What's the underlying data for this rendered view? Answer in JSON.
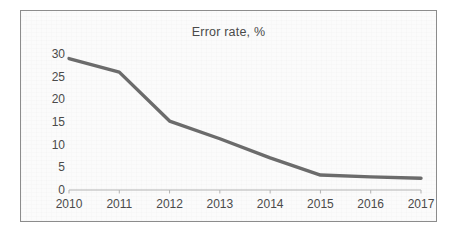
{
  "chart_data": {
    "type": "line",
    "title": "Error rate, %",
    "xlabel": "",
    "ylabel": "",
    "categories": [
      "2010",
      "2011",
      "2012",
      "2013",
      "2014",
      "2015",
      "2016",
      "2017"
    ],
    "x": [
      2010,
      2011,
      2012,
      2013,
      2014,
      2015,
      2016,
      2017
    ],
    "values": [
      29,
      26,
      15.2,
      11.3,
      7.1,
      3.3,
      2.9,
      2.6
    ],
    "series": [
      {
        "name": "Error rate",
        "values": [
          29,
          26,
          15.2,
          11.3,
          7.1,
          3.3,
          2.9,
          2.6
        ]
      }
    ],
    "ylim": [
      0,
      30
    ],
    "y_ticks": [
      0,
      5,
      10,
      15,
      20,
      25,
      30
    ],
    "y_tick_labels": [
      "0",
      "5",
      "10",
      "15",
      "20",
      "25",
      "30"
    ],
    "grid": false,
    "legend": "none",
    "line_color": "#6b6b6b",
    "axis_color": "#b3b3b3",
    "text_color": "#4a4a4a",
    "border_color": "#8c8c8c",
    "background_color": "#fbfbfb"
  }
}
